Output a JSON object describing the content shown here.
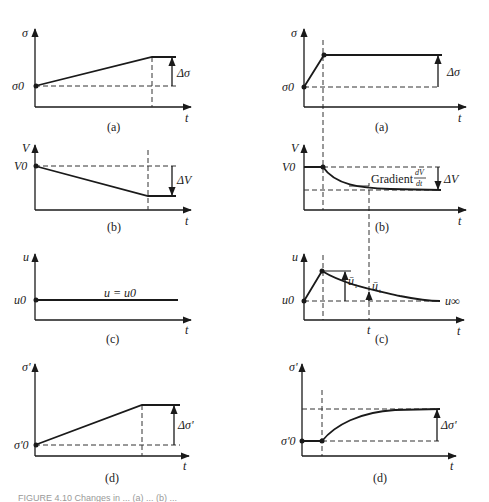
{
  "figure": {
    "caption": "FIGURE 4.10  Changes in ... (a) ... (b) ...",
    "left_column": {
      "panels": [
        {
          "id": "a",
          "label": "(a)",
          "y_label": "σ",
          "x_label": "t",
          "origin_label": "σ0",
          "delta_label": "Δσ",
          "description": "Stress rising linearly from σ0 then constant"
        },
        {
          "id": "b",
          "label": "(b)",
          "y_label": "V",
          "x_label": "t",
          "origin_label": "V0",
          "delta_label": "ΔV",
          "description": "Volume decreasing linearly from V0 then constant"
        },
        {
          "id": "c",
          "label": "(c)",
          "y_label": "u",
          "x_label": "t",
          "origin_label": "u0",
          "curve_label": "u = u0",
          "description": "Pore pressure constant at u0"
        },
        {
          "id": "d",
          "label": "(d)",
          "y_label": "σ'",
          "x_label": "t",
          "origin_label": "σ'0",
          "delta_label": "Δσ'",
          "description": "Effective stress rising linearly from σ'0 then constant"
        }
      ]
    },
    "right_column": {
      "panels": [
        {
          "id": "a",
          "label": "(a)",
          "y_label": "σ",
          "x_label": "t",
          "origin_label": "σ0",
          "delta_label": "Δσ",
          "description": "Rapid stress increase then constant"
        },
        {
          "id": "b",
          "label": "(b)",
          "y_label": "V",
          "x_label": "t",
          "origin_label": "V0",
          "delta_label": "ΔV",
          "gradient_label": "Gradient",
          "gradient_num": "dV",
          "gradient_den": "dt",
          "description": "Volume decays exponentially after loading"
        },
        {
          "id": "c",
          "label": "(c)",
          "y_label": "u",
          "x_label": "t",
          "origin_label": "u0",
          "excess_initial_label": "ū",
          "excess_initial_sub": "i",
          "excess_t_label": "ū",
          "excess_t_sub": "t",
          "time_label": "t",
          "final_label": "u∞",
          "description": "Pore pressure jumps then dissipates to u∞"
        },
        {
          "id": "d",
          "label": "(d)",
          "y_label": "σ'",
          "x_label": "t",
          "origin_label": "σ'0",
          "delta_label": "Δσ'",
          "description": "Effective stress increases gradually to plateau"
        }
      ]
    }
  }
}
